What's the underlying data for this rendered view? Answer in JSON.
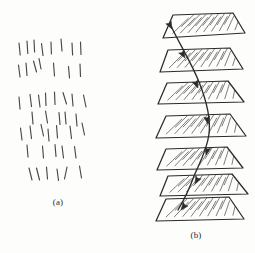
{
  "figure": {
    "background_color": "#fdfdfc",
    "ink_color": "#2b2b2b",
    "width": 255,
    "height": 253
  },
  "panels": [
    {
      "id": "panel-a",
      "caption": "(a)",
      "caption_x": 58,
      "caption_y": 205,
      "description": "scattered short line segments",
      "bounds": {
        "x": 14,
        "y": 36,
        "width": 92,
        "height": 150
      }
    },
    {
      "id": "panel-b",
      "caption": "(b)",
      "caption_x": 196,
      "caption_y": 238,
      "description": "stack of hatched trapezoidal slices traversed by a curve",
      "bounds": {
        "x": 150,
        "y": 12,
        "width": 100,
        "height": 210
      }
    }
  ],
  "panel_a": {
    "stroke_color": "#3a3a3a",
    "stroke_width": 1.15,
    "segments": [
      {
        "x1": 19.0,
        "y1": 43.0,
        "x2": 20.2,
        "y2": 55.0
      },
      {
        "x1": 27.0,
        "y1": 41.0,
        "x2": 27.8,
        "y2": 53.5
      },
      {
        "x1": 34.0,
        "y1": 40.0,
        "x2": 34.6,
        "y2": 52.0
      },
      {
        "x1": 41.5,
        "y1": 43.5,
        "x2": 43.0,
        "y2": 55.5
      },
      {
        "x1": 51.0,
        "y1": 42.0,
        "x2": 51.4,
        "y2": 54.0
      },
      {
        "x1": 61.0,
        "y1": 39.0,
        "x2": 62.0,
        "y2": 51.0
      },
      {
        "x1": 72.0,
        "y1": 43.0,
        "x2": 72.6,
        "y2": 55.0
      },
      {
        "x1": 80.5,
        "y1": 42.0,
        "x2": 81.0,
        "y2": 54.5
      },
      {
        "x1": 18.5,
        "y1": 65.0,
        "x2": 20.0,
        "y2": 77.0
      },
      {
        "x1": 26.0,
        "y1": 63.0,
        "x2": 27.0,
        "y2": 75.5
      },
      {
        "x1": 33.5,
        "y1": 61.0,
        "x2": 36.5,
        "y2": 72.0
      },
      {
        "x1": 39.0,
        "y1": 58.5,
        "x2": 41.0,
        "y2": 69.0
      },
      {
        "x1": 53.5,
        "y1": 63.0,
        "x2": 54.5,
        "y2": 76.0
      },
      {
        "x1": 68.5,
        "y1": 66.5,
        "x2": 69.5,
        "y2": 78.0
      },
      {
        "x1": 80.0,
        "y1": 64.0,
        "x2": 80.5,
        "y2": 76.5
      },
      {
        "x1": 19.0,
        "y1": 97.0,
        "x2": 20.0,
        "y2": 109.0
      },
      {
        "x1": 30.0,
        "y1": 94.5,
        "x2": 31.5,
        "y2": 106.5
      },
      {
        "x1": 38.5,
        "y1": 95.0,
        "x2": 40.0,
        "y2": 107.0
      },
      {
        "x1": 45.5,
        "y1": 93.0,
        "x2": 46.0,
        "y2": 105.5
      },
      {
        "x1": 54.5,
        "y1": 92.0,
        "x2": 55.0,
        "y2": 104.5
      },
      {
        "x1": 63.0,
        "y1": 92.5,
        "x2": 66.5,
        "y2": 104.0
      },
      {
        "x1": 72.0,
        "y1": 94.0,
        "x2": 73.0,
        "y2": 106.0
      },
      {
        "x1": 83.5,
        "y1": 95.0,
        "x2": 86.0,
        "y2": 107.0
      },
      {
        "x1": 32.0,
        "y1": 112.0,
        "x2": 33.0,
        "y2": 124.0
      },
      {
        "x1": 45.5,
        "y1": 111.0,
        "x2": 47.5,
        "y2": 123.0
      },
      {
        "x1": 59.0,
        "y1": 112.5,
        "x2": 60.0,
        "y2": 124.5
      },
      {
        "x1": 65.0,
        "y1": 112.0,
        "x2": 66.0,
        "y2": 124.0
      },
      {
        "x1": 76.0,
        "y1": 114.0,
        "x2": 77.0,
        "y2": 126.0
      },
      {
        "x1": 20.5,
        "y1": 128.0,
        "x2": 22.0,
        "y2": 140.0
      },
      {
        "x1": 30.0,
        "y1": 126.0,
        "x2": 31.5,
        "y2": 138.5
      },
      {
        "x1": 41.0,
        "y1": 124.5,
        "x2": 43.5,
        "y2": 136.0
      },
      {
        "x1": 48.0,
        "y1": 129.0,
        "x2": 49.0,
        "y2": 141.0
      },
      {
        "x1": 56.5,
        "y1": 125.5,
        "x2": 57.5,
        "y2": 138.0
      },
      {
        "x1": 70.0,
        "y1": 126.0,
        "x2": 71.5,
        "y2": 138.5
      },
      {
        "x1": 82.0,
        "y1": 123.0,
        "x2": 84.5,
        "y2": 135.0
      },
      {
        "x1": 27.0,
        "y1": 145.0,
        "x2": 28.0,
        "y2": 157.0
      },
      {
        "x1": 42.5,
        "y1": 146.0,
        "x2": 43.5,
        "y2": 158.0
      },
      {
        "x1": 55.0,
        "y1": 144.5,
        "x2": 56.0,
        "y2": 156.5
      },
      {
        "x1": 62.0,
        "y1": 146.0,
        "x2": 63.5,
        "y2": 158.0
      },
      {
        "x1": 74.5,
        "y1": 146.5,
        "x2": 76.0,
        "y2": 158.0
      },
      {
        "x1": 29.0,
        "y1": 168.0,
        "x2": 32.0,
        "y2": 180.0
      },
      {
        "x1": 36.5,
        "y1": 168.0,
        "x2": 39.5,
        "y2": 180.0
      },
      {
        "x1": 46.5,
        "y1": 167.0,
        "x2": 47.5,
        "y2": 179.0
      },
      {
        "x1": 57.0,
        "y1": 169.0,
        "x2": 58.5,
        "y2": 180.5
      },
      {
        "x1": 67.0,
        "y1": 167.0,
        "x2": 64.5,
        "y2": 179.0
      },
      {
        "x1": 79.5,
        "y1": 166.0,
        "x2": 81.5,
        "y2": 178.0
      }
    ]
  },
  "panel_b": {
    "stroke_color": "#2b2b2b",
    "outline_width": 1.25,
    "hatch_width": 0.85,
    "slice_count": 7,
    "slices": [
      {
        "index": 1,
        "outline": "163,38 173,15 233,13 245,33",
        "hatch": [
          "170,33 182,25",
          "176,36 196,23",
          "188,35 208,22",
          "200,34 220,21",
          "212,33 231,20",
          "224,32 240,22",
          "182,20 194,16",
          "206,18 219,15",
          "228,17 238,16"
        ]
      },
      {
        "index": 2,
        "outline": "160,72 168,50 230,48 243,69"
      },
      {
        "index": 3,
        "outline": "158,104 167,83 228,81 244,102"
      },
      {
        "index": 4,
        "outline": "156,138 166,116 230,114 246,136"
      },
      {
        "index": 5,
        "outline": "157,170 166,149 227,147 243,168"
      },
      {
        "index": 6,
        "outline": "160,196 168,176 232,174 248,194"
      },
      {
        "index": 7,
        "outline": "156,221 166,199 229,197 244,219"
      }
    ],
    "curve": {
      "path": "M 171,26 C 180,45 191,62 199,82 C 207,102 211,118 209,134 C 207,150 200,162 194,176 C 189,190 184,200 178,210",
      "arrow_count": 7,
      "description": "traced fiber path threading all seven slices, arrowheads marking direction"
    },
    "arrows": [
      {
        "slice": 1,
        "x": 172,
        "y": 29,
        "angle": 62
      },
      {
        "slice": 2,
        "x": 185,
        "y": 58,
        "angle": 60
      },
      {
        "slice": 3,
        "x": 198,
        "y": 88,
        "angle": 66
      },
      {
        "slice": 4,
        "x": 208,
        "y": 124,
        "angle": 80
      },
      {
        "slice": 5,
        "x": 206,
        "y": 155,
        "angle": 104
      },
      {
        "slice": 6,
        "x": 195,
        "y": 184,
        "angle": 118
      },
      {
        "slice": 7,
        "x": 181,
        "y": 210,
        "angle": 128
      }
    ]
  }
}
